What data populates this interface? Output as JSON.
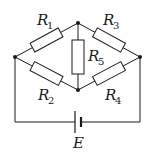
{
  "diagram": {
    "colors": {
      "stroke": "#1a1a1a",
      "background": "#ffffff"
    },
    "nodes": {
      "left": {
        "x": 15,
        "y": 57
      },
      "top": {
        "x": 78,
        "y": 23
      },
      "right": {
        "x": 140,
        "y": 57
      },
      "bottom": {
        "x": 78,
        "y": 90
      }
    },
    "resistors": [
      {
        "id": "R1",
        "letter": "R",
        "sub": "1",
        "from": "left",
        "to": "top"
      },
      {
        "id": "R3",
        "letter": "R",
        "sub": "3",
        "from": "top",
        "to": "right"
      },
      {
        "id": "R2",
        "letter": "R",
        "sub": "2",
        "from": "left",
        "to": "bottom"
      },
      {
        "id": "R4",
        "letter": "R",
        "sub": "4",
        "from": "bottom",
        "to": "right"
      },
      {
        "id": "R5",
        "letter": "R",
        "sub": "5",
        "from": "top",
        "to": "bottom"
      }
    ],
    "source": {
      "id": "E",
      "label": "E",
      "type": "battery"
    }
  }
}
